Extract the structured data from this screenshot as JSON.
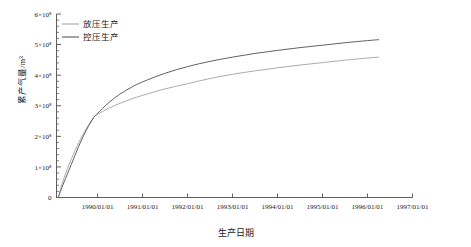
{
  "chart_data": {
    "type": "line",
    "title": "",
    "xlabel": "生产日期",
    "ylabel": "累产气量/m³",
    "grid": false,
    "legend_position": "top-left-inside",
    "xlim": [
      "1989/02/01",
      "1997/01/01"
    ],
    "ylim": [
      0,
      600000000
    ],
    "xticklabels": [
      "1990/01/01",
      "1991/01/01",
      "1992/01/01",
      "1993/01/01",
      "1994/01/01",
      "1995/01/01",
      "1996/01/01",
      "1997/01/01"
    ],
    "yticklabels": [
      "0",
      "1×10⁸",
      "2×10⁸",
      "3×10⁸",
      "4×10⁸",
      "5×10⁸",
      "6×10⁸"
    ],
    "ytickvalues": [
      0,
      100000000,
      200000000,
      300000000,
      400000000,
      500000000,
      600000000
    ],
    "yminor_per_major": 5,
    "series": [
      {
        "name": "放压生产",
        "color": "#a6a6a6",
        "x": [
          "1989/02/15",
          "1989/04/01",
          "1989/06/01",
          "1989/08/01",
          "1989/10/01",
          "1989/12/01",
          "1990/01/01",
          "1990/04/01",
          "1990/07/01",
          "1990/10/01",
          "1991/01/01",
          "1991/07/01",
          "1992/01/01",
          "1992/07/01",
          "1993/01/01",
          "1993/07/01",
          "1994/01/01",
          "1994/07/01",
          "1995/01/01",
          "1995/07/01",
          "1996/01/01",
          "1996/04/01"
        ],
        "values": [
          0,
          62000000,
          125000000,
          180000000,
          225000000,
          262000000,
          272000000,
          292000000,
          308000000,
          322000000,
          334000000,
          355000000,
          372000000,
          389000000,
          403000000,
          414000000,
          424000000,
          433000000,
          441000000,
          449000000,
          456000000,
          459000000
        ]
      },
      {
        "name": "控压生产",
        "color": "#595959",
        "x": [
          "1989/02/15",
          "1989/04/01",
          "1989/06/01",
          "1989/08/01",
          "1989/10/01",
          "1989/12/01",
          "1990/01/01",
          "1990/04/01",
          "1990/07/01",
          "1990/10/01",
          "1991/01/01",
          "1991/07/01",
          "1992/01/01",
          "1992/07/01",
          "1993/01/01",
          "1993/07/01",
          "1994/01/01",
          "1994/07/01",
          "1995/01/01",
          "1995/07/01",
          "1996/01/01",
          "1996/04/01"
        ],
        "values": [
          0,
          48000000,
          108000000,
          168000000,
          220000000,
          262000000,
          275000000,
          310000000,
          338000000,
          360000000,
          378000000,
          406000000,
          428000000,
          445000000,
          459000000,
          471000000,
          481000000,
          490000000,
          498000000,
          506000000,
          513000000,
          516000000
        ]
      }
    ]
  },
  "legend": {
    "items": [
      {
        "label": "放压生产",
        "color": "#a6a6a6"
      },
      {
        "label": "控压生产",
        "color": "#595959"
      }
    ]
  },
  "axes": {
    "ylabel": "累产气量/m³",
    "xlabel": "生产日期"
  }
}
